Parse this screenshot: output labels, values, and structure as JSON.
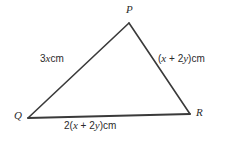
{
  "figure": {
    "type": "triangle-diagram",
    "background_color": "#ffffff",
    "stroke_color": "#3a3a3a",
    "text_color": "#2b2b2b"
  },
  "vertices": {
    "P": {
      "label": "P",
      "x": 129,
      "y": 23
    },
    "Q": {
      "label": "Q",
      "x": 28,
      "y": 118
    },
    "R": {
      "label": "R",
      "x": 190,
      "y": 114
    }
  },
  "sides": {
    "PQ": {
      "coefficient": "3",
      "variable": "x",
      "unit": "cm",
      "full_text": "3x cm"
    },
    "PR": {
      "open_paren": "(",
      "var1": "x",
      "operator": " + ",
      "coefficient2": "2",
      "var2": "y",
      "close_paren": ")",
      "unit": "cm",
      "full_text": "(x + 2y) cm"
    },
    "QR": {
      "outer_coefficient": "2",
      "open_paren": "(",
      "var1": "x",
      "operator": " + ",
      "coefficient2": "2",
      "var2": "y",
      "close_paren": ")",
      "unit": "cm",
      "full_text": "2(x + 2y) cm"
    }
  }
}
